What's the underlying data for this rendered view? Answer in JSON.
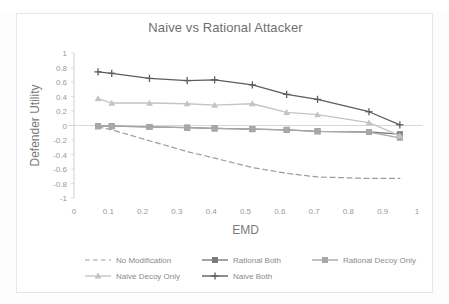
{
  "chart_data": {
    "type": "line",
    "title": "Naive vs Rational Attacker",
    "xlabel": "EMD",
    "ylabel": "Defender Utility",
    "xlim": [
      0,
      1
    ],
    "ylim": [
      -1,
      1
    ],
    "xticks": [
      "0",
      "0.1",
      "0.2",
      "0.3",
      "0.4",
      "0.5",
      "0.6",
      "0.7",
      "0.8",
      "0.9",
      "1"
    ],
    "yticks": [
      "1",
      "0.8",
      "0.6",
      "0.4",
      "0.2",
      "0",
      "-0.2",
      "-0.4",
      "-0.6",
      "-0.8",
      "-1"
    ],
    "grid": false,
    "legend_position": "bottom",
    "x": [
      0.07,
      0.11,
      0.22,
      0.33,
      0.41,
      0.52,
      0.62,
      0.71,
      0.86,
      0.95
    ],
    "series": [
      {
        "name": "No Modification",
        "marker": "none",
        "line": "dashed",
        "color": "#9c9c9c",
        "values": [
          -0.02,
          -0.06,
          -0.21,
          -0.36,
          -0.45,
          -0.58,
          -0.66,
          -0.71,
          -0.73,
          -0.73
        ]
      },
      {
        "name": "Rational Both",
        "marker": "square",
        "line": "solid",
        "color": "#7b7b7b",
        "values": [
          -0.01,
          -0.01,
          -0.02,
          -0.03,
          -0.04,
          -0.05,
          -0.06,
          -0.08,
          -0.09,
          -0.12
        ]
      },
      {
        "name": "Rational Decoy Only",
        "marker": "square",
        "line": "solid",
        "color": "#a8a8a8",
        "values": [
          -0.01,
          -0.01,
          -0.02,
          -0.03,
          -0.04,
          -0.05,
          -0.06,
          -0.08,
          -0.09,
          -0.17
        ]
      },
      {
        "name": "Naive Decoy Only",
        "marker": "triangle",
        "line": "solid",
        "color": "#c4c4c4",
        "values": [
          0.37,
          0.31,
          0.31,
          0.3,
          0.28,
          0.3,
          0.18,
          0.15,
          0.04,
          -0.14
        ]
      },
      {
        "name": "Naive Both",
        "marker": "plus",
        "line": "solid",
        "color": "#5d5d5d",
        "values": [
          0.74,
          0.72,
          0.65,
          0.62,
          0.63,
          0.56,
          0.43,
          0.36,
          0.19,
          0.01
        ]
      }
    ]
  },
  "legend": {
    "items": [
      {
        "label": "No Modification"
      },
      {
        "label": "Rational Both"
      },
      {
        "label": "Rational Decoy Only"
      },
      {
        "label": "Naive Decoy Only"
      },
      {
        "label": "Naive Both"
      }
    ]
  }
}
